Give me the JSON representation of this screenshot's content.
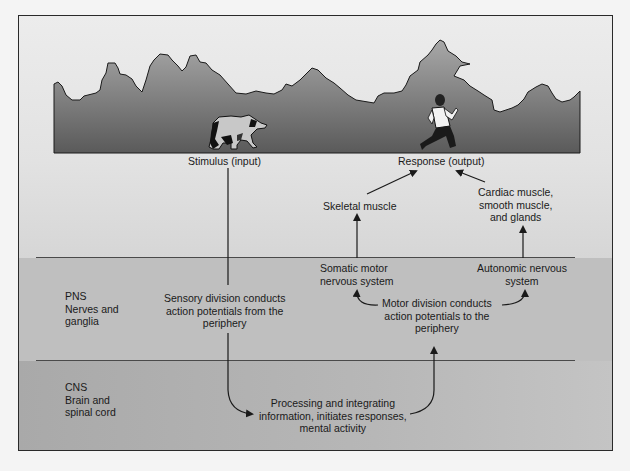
{
  "figure": {
    "scene": {
      "stimulus_icon": "bear-icon",
      "response_icon": "running-person-icon",
      "background": "treeline-silhouette"
    },
    "labels": {
      "stimulus": "Stimulus (input)",
      "response": "Response (output)",
      "skeletal_muscle": "Skeletal muscle",
      "effectors": [
        "Cardiac muscle,",
        "smooth muscle,",
        "and glands"
      ],
      "somatic": [
        "Somatic motor",
        "nervous system"
      ],
      "autonomic": [
        "Autonomic nervous",
        "system"
      ],
      "sensory_division": [
        "Sensory division conducts",
        "action potentials from the",
        "periphery"
      ],
      "motor_division": [
        "Motor division conducts",
        "action potentials to the",
        "periphery"
      ],
      "processing": [
        "Processing and integrating",
        "information, initiates responses,",
        "mental activity"
      ]
    },
    "regions": {
      "pns": [
        "PNS",
        "Nerves and",
        "ganglia"
      ],
      "cns": [
        "CNS",
        "Brain and",
        "spinal cord"
      ]
    },
    "colors": {
      "page": "#f4f4f4",
      "sky": "#e6e6e6",
      "treeline_top": "#9a9a9a",
      "treeline_bottom": "#5e5e5e",
      "pns_band": "#bfbfbf",
      "cns_band": "#b0b0b0",
      "lines": "#1a1a1a"
    }
  }
}
